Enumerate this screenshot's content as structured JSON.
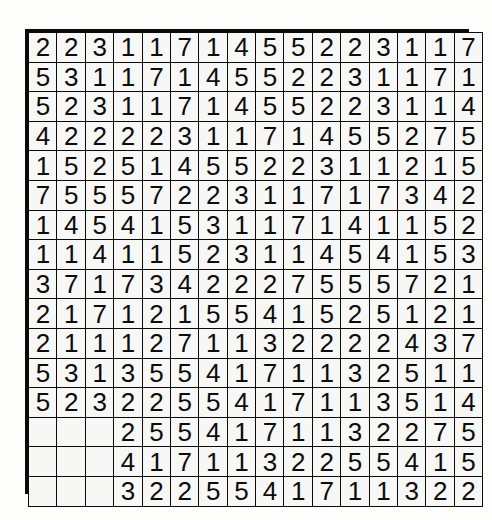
{
  "page": {
    "background_color": "#fdfdfc",
    "grid_line_color": "#0a0a0a",
    "cell_background_color": "#f7f7f5",
    "digit_color": "#0c0c0c",
    "rows": 16,
    "columns": 16
  },
  "grid": {
    "cells": [
      [
        "2",
        "2",
        "3",
        "1",
        "1",
        "7",
        "1",
        "4",
        "5",
        "5",
        "2",
        "2",
        "3",
        "1",
        "1",
        "7"
      ],
      [
        "5",
        "3",
        "1",
        "1",
        "7",
        "1",
        "4",
        "5",
        "5",
        "2",
        "2",
        "3",
        "1",
        "1",
        "7",
        "1"
      ],
      [
        "5",
        "2",
        "3",
        "1",
        "1",
        "7",
        "1",
        "4",
        "5",
        "5",
        "2",
        "2",
        "3",
        "1",
        "1",
        "4"
      ],
      [
        "4",
        "2",
        "2",
        "2",
        "2",
        "3",
        "1",
        "1",
        "7",
        "1",
        "4",
        "5",
        "5",
        "2",
        "7",
        "5"
      ],
      [
        "1",
        "5",
        "2",
        "5",
        "1",
        "4",
        "5",
        "5",
        "2",
        "2",
        "3",
        "1",
        "1",
        "2",
        "1",
        "5"
      ],
      [
        "7",
        "5",
        "5",
        "5",
        "7",
        "2",
        "2",
        "3",
        "1",
        "1",
        "7",
        "1",
        "7",
        "3",
        "4",
        "2"
      ],
      [
        "1",
        "4",
        "5",
        "4",
        "1",
        "5",
        "3",
        "1",
        "1",
        "7",
        "1",
        "4",
        "1",
        "1",
        "5",
        "2"
      ],
      [
        "1",
        "1",
        "4",
        "1",
        "1",
        "5",
        "2",
        "3",
        "1",
        "1",
        "4",
        "5",
        "4",
        "1",
        "5",
        "3"
      ],
      [
        "3",
        "7",
        "1",
        "7",
        "3",
        "4",
        "2",
        "2",
        "2",
        "7",
        "5",
        "5",
        "5",
        "7",
        "2",
        "1"
      ],
      [
        "2",
        "1",
        "7",
        "1",
        "2",
        "1",
        "5",
        "5",
        "4",
        "1",
        "5",
        "2",
        "5",
        "1",
        "2",
        "1"
      ],
      [
        "2",
        "1",
        "1",
        "1",
        "2",
        "7",
        "1",
        "1",
        "3",
        "2",
        "2",
        "2",
        "2",
        "4",
        "3",
        "7"
      ],
      [
        "5",
        "3",
        "1",
        "3",
        "5",
        "5",
        "4",
        "1",
        "7",
        "1",
        "1",
        "3",
        "2",
        "5",
        "1",
        "1"
      ],
      [
        "5",
        "2",
        "3",
        "2",
        "2",
        "5",
        "5",
        "4",
        "1",
        "7",
        "1",
        "1",
        "3",
        "5",
        "1",
        "4"
      ],
      [
        "",
        "",
        "",
        "2",
        "5",
        "5",
        "4",
        "1",
        "7",
        "1",
        "1",
        "3",
        "2",
        "2",
        "7",
        "5"
      ],
      [
        "",
        "",
        "",
        "4",
        "1",
        "7",
        "1",
        "1",
        "3",
        "2",
        "2",
        "5",
        "5",
        "4",
        "1",
        "5"
      ],
      [
        "",
        "",
        "",
        "3",
        "2",
        "2",
        "5",
        "5",
        "4",
        "1",
        "7",
        "1",
        "1",
        "3",
        "2",
        "2"
      ]
    ]
  }
}
